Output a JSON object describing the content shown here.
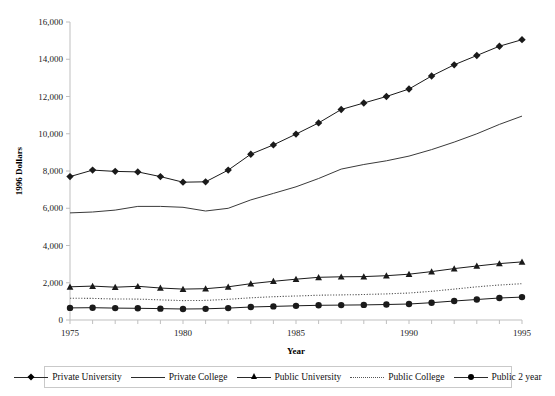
{
  "chart_data": {
    "type": "line",
    "title": "",
    "xlabel": "Year",
    "ylabel": "1996 Dollars",
    "xlim": [
      1975,
      1995
    ],
    "ylim": [
      0,
      16000
    ],
    "grid": false,
    "legend_position": "bottom",
    "x": [
      1975,
      1976,
      1977,
      1978,
      1979,
      1980,
      1981,
      1982,
      1983,
      1984,
      1985,
      1986,
      1987,
      1988,
      1989,
      1990,
      1991,
      1992,
      1993,
      1994,
      1995
    ],
    "xtick_labels": [
      "1975",
      "1980",
      "1985",
      "1990",
      "1995"
    ],
    "xtick_values": [
      1975,
      1980,
      1985,
      1990,
      1995
    ],
    "ytick_labels": [
      "0",
      "2,000",
      "4,000",
      "6,000",
      "8,000",
      "10,000",
      "12,000",
      "14,000",
      "16,000"
    ],
    "ytick_values": [
      0,
      2000,
      4000,
      6000,
      8000,
      10000,
      12000,
      14000,
      16000
    ],
    "series": [
      {
        "name": "Private University",
        "marker": "diamond",
        "line": "solid",
        "color": "#1a1a1a",
        "values": [
          7700,
          8050,
          7980,
          7950,
          7700,
          7400,
          7420,
          8050,
          8900,
          9400,
          9980,
          10580,
          11300,
          11650,
          12000,
          12400,
          13100,
          13700,
          14200,
          14700,
          15050
        ]
      },
      {
        "name": "Private College",
        "marker": "none",
        "line": "solid",
        "color": "#3a3a3a",
        "values": [
          5750,
          5800,
          5900,
          6100,
          6100,
          6050,
          5850,
          6000,
          6450,
          6800,
          7150,
          7600,
          8100,
          8350,
          8550,
          8800,
          9150,
          9550,
          10000,
          10500,
          10950
        ]
      },
      {
        "name": "Public University",
        "marker": "triangle",
        "line": "solid",
        "color": "#1a1a1a",
        "values": [
          1780,
          1820,
          1760,
          1810,
          1720,
          1660,
          1680,
          1780,
          1950,
          2080,
          2190,
          2290,
          2320,
          2330,
          2380,
          2460,
          2600,
          2760,
          2900,
          3030,
          3120
        ]
      },
      {
        "name": "Public College",
        "marker": "none",
        "line": "dotted",
        "color": "#555555",
        "values": [
          1170,
          1160,
          1130,
          1120,
          1080,
          1040,
          1050,
          1110,
          1190,
          1250,
          1290,
          1330,
          1350,
          1370,
          1400,
          1450,
          1540,
          1660,
          1780,
          1880,
          1950
        ]
      },
      {
        "name": "Public  2 year",
        "marker": "circle",
        "line": "solid",
        "color": "#1a1a1a",
        "values": [
          650,
          660,
          640,
          630,
          610,
          590,
          600,
          640,
          700,
          730,
          760,
          790,
          800,
          810,
          830,
          860,
          930,
          1020,
          1100,
          1180,
          1230
        ]
      }
    ]
  },
  "legend": {
    "items": [
      {
        "label": "Private University"
      },
      {
        "label": "Private College"
      },
      {
        "label": "Public University"
      },
      {
        "label": "Public College"
      },
      {
        "label": "Public  2 year"
      }
    ]
  }
}
